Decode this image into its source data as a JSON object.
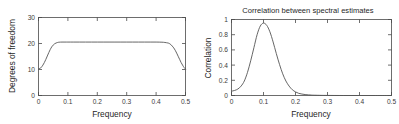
{
  "figure": {
    "background": "#ffffff",
    "axis_color": "#4a4a4a",
    "curve_color": "#555555",
    "panel_count": 2
  },
  "chart_data": [
    {
      "type": "line",
      "panel": "left",
      "title": "",
      "xlabel": "Frequency",
      "ylabel": "Degrees of freedom",
      "xlim": [
        0,
        0.5
      ],
      "ylim": [
        0,
        30
      ],
      "xticks": [
        0,
        0.1,
        0.2,
        0.3,
        0.4,
        0.5
      ],
      "xticklabels": [
        "0",
        "0.1",
        "0.2",
        "0.3",
        "0.4",
        "0.5"
      ],
      "yticks": [
        0,
        10,
        20,
        30
      ],
      "yticklabels": [
        "0",
        "10",
        "20",
        "30"
      ],
      "grid": false,
      "legend": null,
      "x": [
        0.0,
        0.005,
        0.01,
        0.015,
        0.02,
        0.025,
        0.03,
        0.035,
        0.04,
        0.045,
        0.05,
        0.055,
        0.06,
        0.065,
        0.07,
        0.08,
        0.09,
        0.1,
        0.12,
        0.14,
        0.16,
        0.18,
        0.2,
        0.22,
        0.24,
        0.26,
        0.28,
        0.3,
        0.32,
        0.34,
        0.36,
        0.38,
        0.4,
        0.42,
        0.43,
        0.44,
        0.445,
        0.45,
        0.455,
        0.46,
        0.465,
        0.47,
        0.475,
        0.48,
        0.485,
        0.49,
        0.495,
        0.5
      ],
      "y": [
        10.2,
        10.4,
        10.9,
        11.7,
        12.7,
        13.9,
        15.2,
        16.5,
        17.7,
        18.7,
        19.4,
        19.9,
        20.2,
        20.4,
        20.5,
        20.55,
        20.55,
        20.55,
        20.55,
        20.55,
        20.55,
        20.55,
        20.55,
        20.55,
        20.55,
        20.55,
        20.55,
        20.55,
        20.55,
        20.55,
        20.55,
        20.55,
        20.55,
        20.5,
        20.4,
        20.2,
        20.0,
        19.6,
        19.0,
        18.3,
        17.4,
        16.3,
        15.1,
        13.9,
        12.7,
        11.7,
        10.8,
        10.2
      ],
      "series": [
        {
          "name": "degrees-of-freedom",
          "values": [
            10.2,
            10.4,
            10.9,
            11.7,
            12.7,
            13.9,
            15.2,
            16.5,
            17.7,
            18.7,
            19.4,
            19.9,
            20.2,
            20.4,
            20.5,
            20.55,
            20.55,
            20.55,
            20.55,
            20.55,
            20.55,
            20.55,
            20.55,
            20.55,
            20.55,
            20.55,
            20.55,
            20.55,
            20.55,
            20.55,
            20.55,
            20.55,
            20.55,
            20.5,
            20.4,
            20.2,
            20.0,
            19.6,
            19.0,
            18.3,
            17.4,
            16.3,
            15.1,
            13.9,
            12.7,
            11.7,
            10.8,
            10.2
          ]
        }
      ],
      "annotations": {
        "plateau_value": 20.55,
        "edge_value": 10.2
      }
    },
    {
      "type": "line",
      "panel": "right",
      "title": "Correlation between spectral estimates",
      "xlabel": "Frequency",
      "ylabel": "Correlation",
      "xlim": [
        0,
        0.5
      ],
      "ylim": [
        0,
        1.05
      ],
      "xticks": [
        0,
        0.1,
        0.2,
        0.3,
        0.4,
        0.5
      ],
      "xticklabels": [
        "0",
        "0.1",
        "0.2",
        "0.3",
        "0.4",
        "0.5"
      ],
      "yticks": [
        0,
        0.2,
        0.4,
        0.6,
        0.8,
        1
      ],
      "yticklabels": [
        "0",
        "0.2",
        "0.4",
        "0.6",
        "0.8",
        "1"
      ],
      "grid": false,
      "legend": null,
      "x": [
        0.0,
        0.01,
        0.02,
        0.03,
        0.04,
        0.05,
        0.06,
        0.07,
        0.08,
        0.09,
        0.1,
        0.11,
        0.12,
        0.13,
        0.14,
        0.15,
        0.16,
        0.17,
        0.18,
        0.19,
        0.2,
        0.21,
        0.22,
        0.23,
        0.24,
        0.25,
        0.26,
        0.28,
        0.3,
        0.35,
        0.4,
        0.45,
        0.5
      ],
      "y": [
        0.06,
        0.07,
        0.09,
        0.13,
        0.2,
        0.32,
        0.48,
        0.66,
        0.84,
        0.96,
        1.0,
        0.97,
        0.88,
        0.74,
        0.58,
        0.43,
        0.3,
        0.2,
        0.13,
        0.08,
        0.05,
        0.03,
        0.02,
        0.013,
        0.009,
        0.006,
        0.004,
        0.002,
        0.001,
        0.0,
        0.0,
        0.0,
        0.0
      ],
      "series": [
        {
          "name": "correlation",
          "values": [
            0.06,
            0.07,
            0.09,
            0.13,
            0.2,
            0.32,
            0.48,
            0.66,
            0.84,
            0.96,
            1.0,
            0.97,
            0.88,
            0.74,
            0.58,
            0.43,
            0.3,
            0.2,
            0.13,
            0.08,
            0.05,
            0.03,
            0.02,
            0.013,
            0.009,
            0.006,
            0.004,
            0.002,
            0.001,
            0.0,
            0.0,
            0.0,
            0.0
          ]
        }
      ],
      "annotations": {
        "peak_x": 0.1,
        "peak_y": 1.0
      }
    }
  ]
}
